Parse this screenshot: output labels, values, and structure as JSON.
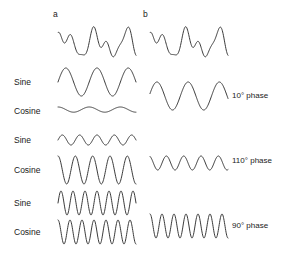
{
  "figure": {
    "background": "#ffffff",
    "stroke_color": "#3a3a3a",
    "panels": [
      {
        "id": "a",
        "letter": "a",
        "x": 53,
        "y": 10
      },
      {
        "id": "b",
        "letter": "b",
        "x": 143,
        "y": 10
      }
    ],
    "row_labels": [
      {
        "text": "Sine",
        "x": 14,
        "y": 78
      },
      {
        "text": "Cosine",
        "x": 14,
        "y": 107
      },
      {
        "text": "Sine",
        "x": 14,
        "y": 136
      },
      {
        "text": "Cosine",
        "x": 14,
        "y": 166
      },
      {
        "text": "Sine",
        "x": 14,
        "y": 199
      },
      {
        "text": "Cosine",
        "x": 14,
        "y": 228
      }
    ],
    "phase_labels": [
      {
        "text": "10° phase",
        "x": 232,
        "y": 92
      },
      {
        "text": "110° phase",
        "x": 232,
        "y": 157
      },
      {
        "text": "90° phase",
        "x": 232,
        "y": 222
      }
    ]
  },
  "chart_data": {
    "type": "line",
    "title": "",
    "subtitle": "",
    "xlabel": "",
    "ylabel": "",
    "grid": false,
    "legend_position": "none",
    "panel_a_letter": "a",
    "panel_b_letter": "b",
    "component_labels": [
      "Sine",
      "Cosine"
    ],
    "phase_values_deg": [
      10,
      110,
      90
    ],
    "phase_label_texts": [
      "10° phase",
      "110° phase",
      "90° phase"
    ],
    "traces": [
      {
        "name": "composite-a",
        "panel": "a",
        "kind": "composite",
        "x0": 58,
        "y0": 44,
        "width": 78,
        "height": 1,
        "amplitude": 20,
        "samples": 220,
        "harmonics": [
          {
            "cycles": 2.5,
            "amp": 1.0,
            "phase_deg": 10
          },
          {
            "cycles": 4.5,
            "amp": 0.55,
            "phase_deg": 110
          },
          {
            "cycles": 6.5,
            "amp": 0.42,
            "phase_deg": 90
          }
        ]
      },
      {
        "name": "composite-b",
        "panel": "b",
        "kind": "composite",
        "x0": 150,
        "y0": 44,
        "width": 78,
        "height": 1,
        "amplitude": 20,
        "samples": 220,
        "harmonics": [
          {
            "cycles": 2.5,
            "amp": 1.0,
            "phase_deg": 10
          },
          {
            "cycles": 4.5,
            "amp": 0.55,
            "phase_deg": 110
          },
          {
            "cycles": 6.5,
            "amp": 0.42,
            "phase_deg": 90
          }
        ]
      },
      {
        "name": "sine-component-1",
        "panel": "a",
        "kind": "sine",
        "x0": 58,
        "y0": 82,
        "width": 78,
        "height": 1,
        "amplitude": 14,
        "samples": 200,
        "harmonics": [
          {
            "cycles": 2.5,
            "amp": 1.0,
            "phase_deg": 0
          }
        ]
      },
      {
        "name": "cosine-component-1",
        "panel": "a",
        "kind": "cosine",
        "x0": 58,
        "y0": 110,
        "width": 78,
        "height": 1,
        "amplitude": 2.6,
        "samples": 200,
        "harmonics": [
          {
            "cycles": 2.5,
            "amp": 1.0,
            "phase_deg": 90
          }
        ]
      },
      {
        "name": "sine-component-2",
        "panel": "a",
        "kind": "sine",
        "x0": 58,
        "y0": 140,
        "width": 78,
        "height": 1,
        "amplitude": 5,
        "samples": 200,
        "harmonics": [
          {
            "cycles": 4.5,
            "amp": 1.0,
            "phase_deg": 0
          }
        ]
      },
      {
        "name": "cosine-component-2",
        "panel": "a",
        "kind": "cosine",
        "x0": 58,
        "y0": 170,
        "width": 78,
        "height": 1,
        "amplitude": 14,
        "samples": 200,
        "harmonics": [
          {
            "cycles": 4.5,
            "amp": 1.0,
            "phase_deg": 90
          }
        ]
      },
      {
        "name": "sine-component-3",
        "panel": "a",
        "kind": "sine",
        "x0": 58,
        "y0": 203,
        "width": 78,
        "height": 1,
        "amplitude": 12,
        "samples": 240,
        "harmonics": [
          {
            "cycles": 6.5,
            "amp": 1.0,
            "phase_deg": 0
          }
        ]
      },
      {
        "name": "cosine-component-3",
        "panel": "a",
        "kind": "cosine",
        "x0": 58,
        "y0": 232,
        "width": 78,
        "height": 1,
        "amplitude": 12,
        "samples": 240,
        "harmonics": [
          {
            "cycles": 6.5,
            "amp": 1.0,
            "phase_deg": 90
          }
        ]
      },
      {
        "name": "phase-wave-1",
        "panel": "b",
        "kind": "phase",
        "x0": 150,
        "y0": 96,
        "width": 78,
        "height": 1,
        "amplitude": 14,
        "samples": 200,
        "harmonics": [
          {
            "cycles": 2.5,
            "amp": 1.0,
            "phase_deg": 10
          }
        ]
      },
      {
        "name": "phase-wave-2",
        "panel": "b",
        "kind": "phase",
        "x0": 150,
        "y0": 163,
        "width": 78,
        "height": 1,
        "amplitude": 7,
        "samples": 200,
        "harmonics": [
          {
            "cycles": 4.5,
            "amp": 1.0,
            "phase_deg": 110
          }
        ]
      },
      {
        "name": "phase-wave-3",
        "panel": "b",
        "kind": "phase",
        "x0": 150,
        "y0": 226,
        "width": 78,
        "height": 1,
        "amplitude": 12,
        "samples": 240,
        "harmonics": [
          {
            "cycles": 6.5,
            "amp": 1.0,
            "phase_deg": 90
          }
        ]
      }
    ]
  }
}
